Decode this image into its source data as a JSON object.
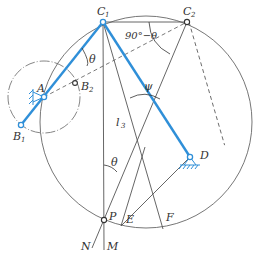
{
  "diagram": {
    "colors": {
      "link": "#2f8fd8",
      "line": "#555555",
      "bg": "#ffffff"
    },
    "labels": {
      "A": "A",
      "B1": "B",
      "B1_sub": "1",
      "B2": "B",
      "B2_sub": "2",
      "C1": "C",
      "C1_sub": "1",
      "C2": "C",
      "C2_sub": "2",
      "D": "D",
      "P": "P",
      "E": "E",
      "F": "F",
      "M": "M",
      "N": "N",
      "theta1": "θ",
      "theta2": "θ",
      "psi": "ψ",
      "l3": "l",
      "l3_sub": "3",
      "angle_90": "90°−θ"
    },
    "nodes": {
      "A": [
        44,
        97
      ],
      "B1": [
        21,
        125
      ],
      "B2": [
        75,
        83
      ],
      "C1": [
        103,
        22
      ],
      "C2": [
        187,
        22
      ],
      "D": [
        190,
        157
      ],
      "P": [
        104,
        220
      ]
    }
  }
}
